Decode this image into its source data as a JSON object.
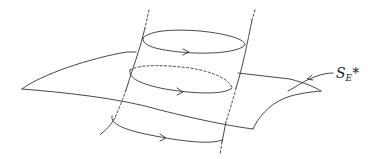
{
  "diagram": {
    "label": {
      "main": "S",
      "subscript": "E",
      "superscript": "*"
    },
    "loops": [
      {
        "name": "top-loop",
        "style": "solid-front, solid-back",
        "arrow": "right"
      },
      {
        "name": "middle-loop",
        "style": "solid-front, dashed-back",
        "arrow": "right"
      },
      {
        "name": "bottom-loop",
        "style": "solid-front",
        "arrow": "right"
      }
    ],
    "colors": {
      "stroke": "#333333",
      "background": "#ffffff"
    }
  }
}
